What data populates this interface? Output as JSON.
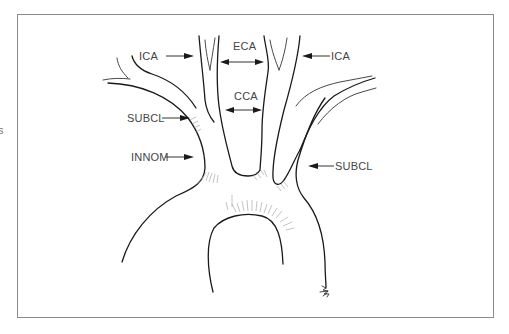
{
  "figure": {
    "type": "anatomical line drawing",
    "edge_fragment_text": "s",
    "colors": {
      "line": "#1a1a1a",
      "label": "#444444",
      "frame": "#8a8a8a",
      "background": "#ffffff"
    }
  },
  "labels": {
    "ica_left": "ICA",
    "eca": "ECA",
    "ica_right": "ICA",
    "cca": "CCA",
    "subcl_left": "SUBCL",
    "innom": "INNOM",
    "subcl_right": "SUBCL"
  },
  "annotations": [
    {
      "id": "ica_left",
      "text": "ICA",
      "arrow": "right"
    },
    {
      "id": "eca",
      "text": "ECA",
      "arrow": "double"
    },
    {
      "id": "ica_right",
      "text": "ICA",
      "arrow": "left"
    },
    {
      "id": "cca",
      "text": "CCA",
      "arrow": "double"
    },
    {
      "id": "subcl_left",
      "text": "SUBCL",
      "arrow": "right"
    },
    {
      "id": "innom",
      "text": "INNOM",
      "arrow": "right"
    },
    {
      "id": "subcl_right",
      "text": "SUBCL",
      "arrow": "left"
    }
  ]
}
